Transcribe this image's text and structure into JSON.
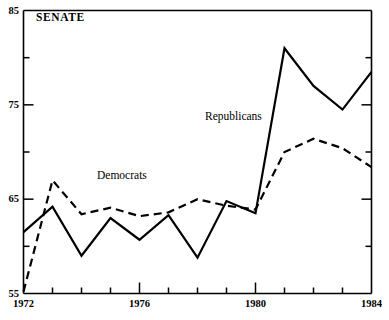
{
  "chart_data": {
    "type": "line",
    "title": "SENATE",
    "xlabel": "",
    "ylabel": "",
    "xlim": [
      1972,
      1984
    ],
    "ylim": [
      55,
      85
    ],
    "grid": false,
    "legend_position": "inline-annotation",
    "x": [
      1972,
      1973,
      1974,
      1975,
      1976,
      1977,
      1978,
      1979,
      1980,
      1981,
      1982,
      1983,
      1984
    ],
    "y_ticks": [
      55,
      65,
      75,
      85
    ],
    "y_minor_ticks": [
      60,
      70,
      80
    ],
    "x_ticks": [
      1972,
      1976,
      1980,
      1984
    ],
    "x_minor_ticks": [
      1973,
      1974,
      1975,
      1977,
      1978,
      1979,
      1981,
      1982,
      1983
    ],
    "series": [
      {
        "name": "Republicans",
        "style": "solid",
        "color": "#000000",
        "values": [
          61.5,
          64.2,
          59.0,
          63.0,
          60.7,
          63.3,
          58.8,
          64.8,
          63.5,
          81.0,
          77.0,
          74.5,
          78.5
        ]
      },
      {
        "name": "Democrats",
        "style": "dashed",
        "color": "#000000",
        "values": [
          55.2,
          67.0,
          63.4,
          64.1,
          63.2,
          63.6,
          65.0,
          64.3,
          63.9,
          70.0,
          71.4,
          70.4,
          68.4
        ]
      }
    ],
    "annotations": [
      {
        "text": "SENATE",
        "x": 1972.5,
        "y": 84.0
      },
      {
        "text": "Democrats",
        "x": 1974.5,
        "y": 68.0
      },
      {
        "text": "Republicans",
        "x": 1978.3,
        "y": 74.2
      }
    ]
  },
  "axis": {
    "y_labels": [
      "85",
      "75",
      "65",
      "55"
    ],
    "x_labels": [
      "1972",
      "1976",
      "1980",
      "1984"
    ]
  },
  "colors": {
    "axis": "#000000",
    "line": "#000000",
    "background": "#ffffff"
  }
}
